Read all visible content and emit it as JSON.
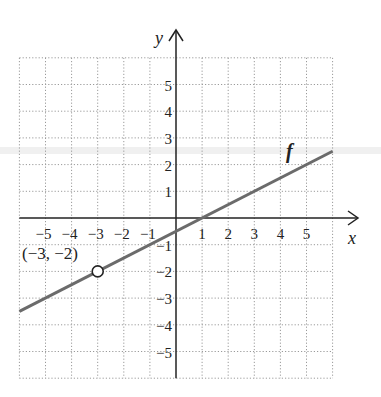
{
  "chart_data": {
    "type": "line",
    "title": "",
    "xlabel": "x",
    "ylabel": "y",
    "xlim": [
      -6,
      6
    ],
    "ylim": [
      -6,
      6
    ],
    "grid": true,
    "x_ticks": [
      "−5",
      "−4",
      "−3",
      "−2",
      "−1",
      "1",
      "2",
      "3",
      "4",
      "5"
    ],
    "y_ticks": [
      "5",
      "4",
      "3",
      "2",
      "1",
      "−1",
      "−2",
      "−3",
      "−4",
      "−5"
    ],
    "series": [
      {
        "name": "f",
        "equation": "y = 0.5x − 0.5",
        "x": [
          -6,
          6
        ],
        "y": [
          -3.5,
          2.5
        ],
        "color": "#6b6b6b"
      }
    ],
    "annotations": [
      {
        "text": "(−3, −2)",
        "x": -3,
        "y": -2,
        "marker": "open-circle"
      },
      {
        "text": "f",
        "x": 4.4,
        "y": 2.6
      }
    ]
  },
  "labels": {
    "x_axis": "x",
    "y_axis": "y",
    "function_name": "f",
    "point": "(−3, −2)"
  }
}
